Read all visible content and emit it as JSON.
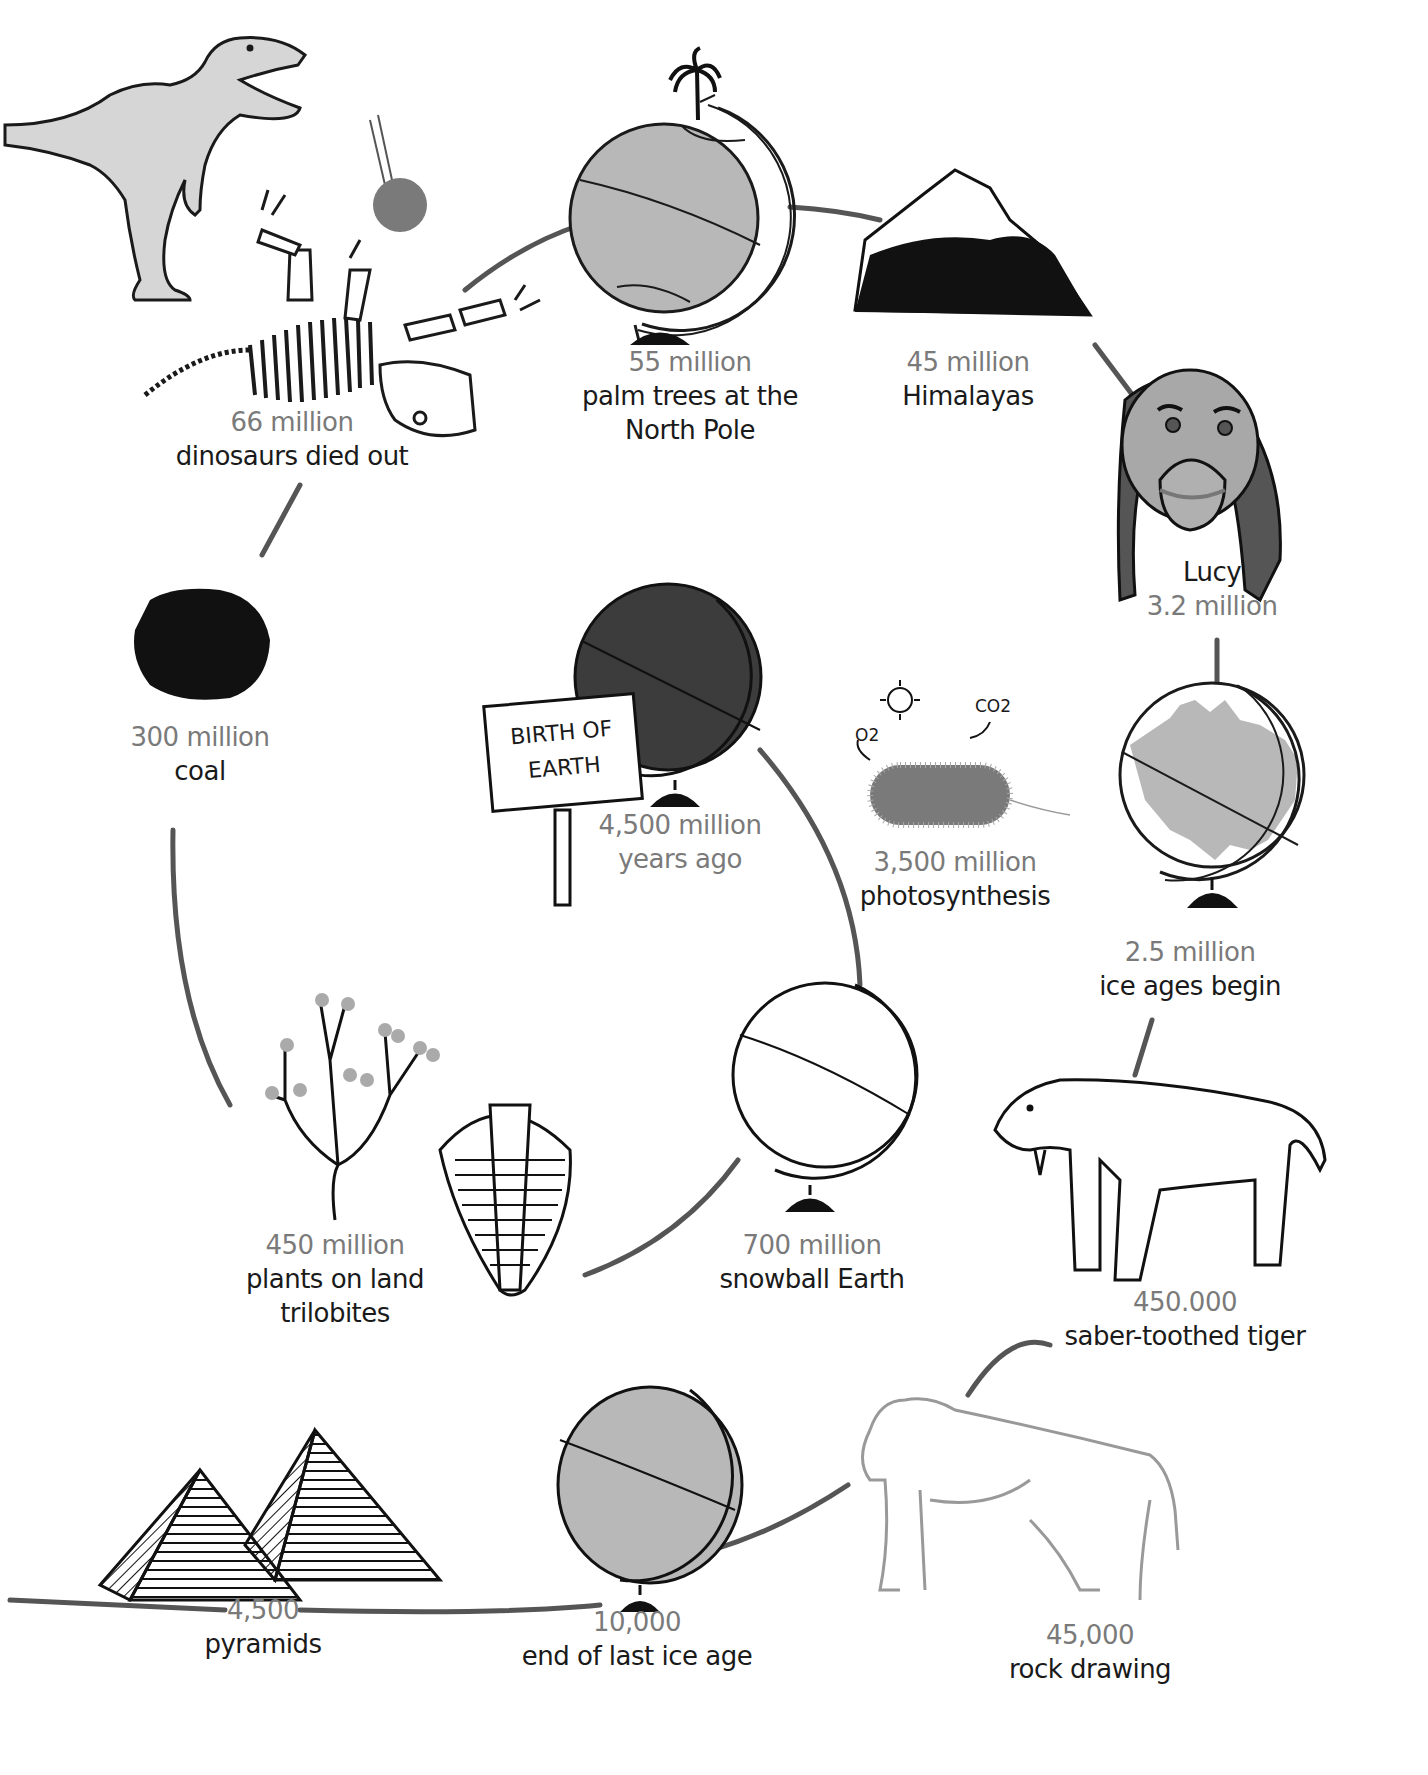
{
  "diagram": {
    "type": "circular timeline (spiral) of Earth history",
    "colors": {
      "line": "#555555",
      "date_text": "#7a7a7a",
      "desc_text": "#1a1a1a",
      "globe_light": "#b8b8b8",
      "globe_dark": "#3c3c3c"
    },
    "sign": {
      "line1": "BIRTH OF",
      "line2": "EARTH"
    },
    "photosynthesis_symbols": {
      "oxygen": "O2",
      "carbon_dioxide": "CO2",
      "sun": "sun-icon"
    },
    "events": [
      {
        "id": "birth",
        "date": "4,500 million",
        "date2": "years ago",
        "illustration": "dark-globe-with-sign"
      },
      {
        "id": "photosynthesis",
        "date": "3,500 million",
        "label": "photosynthesis",
        "illustration": "bacterium"
      },
      {
        "id": "snowball",
        "date": "700 million",
        "label": "snowball Earth",
        "illustration": "white-globe"
      },
      {
        "id": "plants",
        "date": "450 million",
        "label": "plants on land",
        "label2": "trilobites",
        "illustration": "plant-and-trilobite"
      },
      {
        "id": "coal",
        "date": "300 million",
        "label": "coal",
        "illustration": "coal-lump"
      },
      {
        "id": "dinosaurs",
        "date": "66 million",
        "label": "dinosaurs died out",
        "illustration": "t-rex-skeleton-meteor"
      },
      {
        "id": "palm",
        "date": "55 million",
        "label": "palm trees at the",
        "label2": "North Pole",
        "illustration": "globe-with-palm-tree"
      },
      {
        "id": "himalayas",
        "date": "45 million",
        "label": "Himalayas",
        "illustration": "mountain"
      },
      {
        "id": "lucy",
        "label": "Lucy",
        "date": "3.2 million",
        "illustration": "hominid-face"
      },
      {
        "id": "iceages",
        "date": "2.5 million",
        "label": "ice ages begin",
        "illustration": "ice-globe"
      },
      {
        "id": "tiger",
        "date": "450.000",
        "label": "saber-toothed tiger",
        "illustration": "saber-toothed-tiger"
      },
      {
        "id": "rock",
        "date": "45,000",
        "label": "rock drawing",
        "illustration": "cave-drawing-animal"
      },
      {
        "id": "iceend",
        "date": "10,000",
        "label": "end of last ice age",
        "illustration": "grey-globe"
      },
      {
        "id": "pyramids",
        "date": "4,500",
        "label": "pyramids",
        "illustration": "pyramids"
      }
    ]
  }
}
